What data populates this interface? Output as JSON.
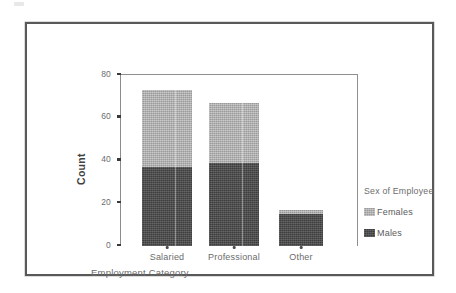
{
  "chart_data": {
    "type": "bar",
    "subtype": "stacked",
    "title": "",
    "xlabel": "Employment Category",
    "ylabel": "Count",
    "categories": [
      "Salaried",
      "Professional",
      "Other"
    ],
    "series": [
      {
        "name": "Males",
        "values": [
          37,
          39,
          15
        ],
        "color": "#3d3d3d"
      },
      {
        "name": "Females",
        "values": [
          36,
          28,
          2
        ],
        "color": "#9a9a9a"
      }
    ],
    "totals": [
      73,
      67,
      17
    ],
    "ylim": [
      0,
      80
    ],
    "yticks": [
      "0",
      "20",
      "40",
      "60",
      "80"
    ],
    "ytick_values": [
      0,
      20,
      40,
      60,
      80
    ],
    "grid": false,
    "legend": {
      "title": "Sex of Employee",
      "position": "right",
      "entries": [
        {
          "label": "Females",
          "color": "#9a9a9a"
        },
        {
          "label": "Males",
          "color": "#3d3d3d"
        }
      ]
    }
  },
  "frame": {
    "border_color": "#595959"
  }
}
